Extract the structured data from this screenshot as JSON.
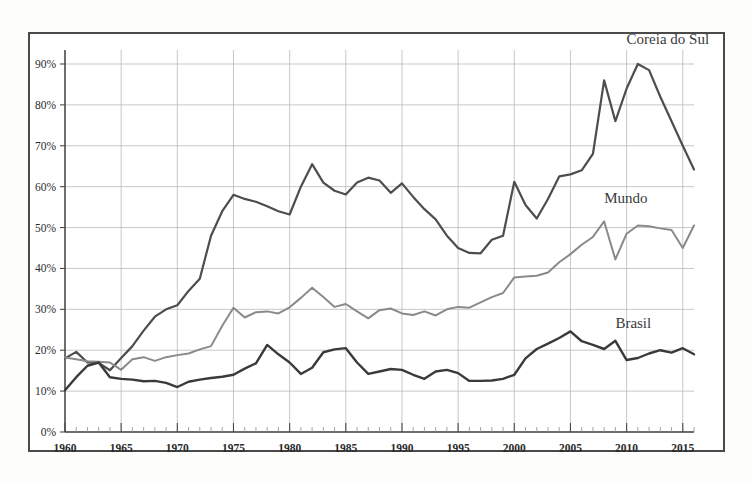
{
  "chart_data": {
    "type": "line",
    "title": "",
    "subtitle": "",
    "xlabel": "",
    "ylabel": "",
    "xlim": [
      1960,
      2016
    ],
    "ylim": [
      0,
      95
    ],
    "grid": true,
    "legend_position": "inline-right",
    "y_ticks": [
      "0%",
      "10%",
      "20%",
      "30%",
      "40%",
      "50%",
      "60%",
      "70%",
      "80%",
      "90%"
    ],
    "y_tick_values": [
      0,
      10,
      20,
      30,
      40,
      50,
      60,
      70,
      80,
      90
    ],
    "x_ticks": [
      "1960",
      "1965",
      "1970",
      "1975",
      "1980",
      "1985",
      "1990",
      "1995",
      "2000",
      "2005",
      "2010",
      "2015"
    ],
    "x_tick_values": [
      1960,
      1965,
      1970,
      1975,
      1980,
      1985,
      1990,
      1995,
      2000,
      2005,
      2010,
      2015
    ],
    "x": [
      1960,
      1961,
      1962,
      1963,
      1964,
      1965,
      1966,
      1967,
      1968,
      1969,
      1970,
      1971,
      1972,
      1973,
      1974,
      1975,
      1976,
      1977,
      1978,
      1979,
      1980,
      1981,
      1982,
      1983,
      1984,
      1985,
      1986,
      1987,
      1988,
      1989,
      1990,
      1991,
      1992,
      1993,
      1994,
      1995,
      1996,
      1997,
      1998,
      1999,
      2000,
      2001,
      2002,
      2003,
      2004,
      2005,
      2006,
      2007,
      2008,
      2009,
      2010,
      2011,
      2012,
      2013,
      2014,
      2015,
      2016
    ],
    "series": [
      {
        "name": "Coreia do Sul",
        "color": "#4d4d4d",
        "width": 2.2,
        "label_x": 2010,
        "label_y": 95,
        "values": [
          18.0,
          19.6,
          17.0,
          16.9,
          15.1,
          18.1,
          21.0,
          24.8,
          28.2,
          30.0,
          31.0,
          34.5,
          37.5,
          48.0,
          54.0,
          58.0,
          57.0,
          56.3,
          55.2,
          54.0,
          53.2,
          60.0,
          65.5,
          61.0,
          59.0,
          58.1,
          61.0,
          62.2,
          61.5,
          58.5,
          60.8,
          57.5,
          54.5,
          52.0,
          48.0,
          45.0,
          43.8,
          43.7,
          47.0,
          48.0,
          61.2,
          55.5,
          52.2,
          57.0,
          62.5,
          63.0,
          64.0,
          68.0,
          86.0,
          76.0,
          84.0,
          90.0,
          88.5,
          82.0,
          76.0,
          70.0,
          64.2
        ]
      },
      {
        "name": "Mundo",
        "color": "#8a8a8a",
        "width": 2.0,
        "label_x": 2008,
        "label_y": 56,
        "values": [
          18.2,
          17.8,
          17.3,
          17.2,
          17.0,
          15.2,
          17.8,
          18.3,
          17.4,
          18.3,
          18.8,
          19.2,
          20.2,
          21.0,
          26.0,
          30.4,
          28.0,
          29.3,
          29.5,
          29.0,
          30.5,
          32.8,
          35.3,
          33.0,
          30.6,
          31.3,
          29.5,
          27.8,
          29.8,
          30.2,
          29.0,
          28.6,
          29.5,
          28.5,
          30.0,
          30.6,
          30.4,
          31.7,
          33.0,
          34.0,
          37.8,
          38.0,
          38.2,
          39.0,
          41.5,
          43.5,
          45.8,
          47.7,
          51.5,
          42.2,
          48.5,
          50.5,
          50.3,
          49.8,
          49.4,
          45.0,
          50.5
        ]
      },
      {
        "name": "Brasil",
        "color": "#3a3a3a",
        "width": 2.4,
        "label_x": 2009,
        "label_y": 25.5,
        "values": [
          10.2,
          13.4,
          16.2,
          17.0,
          13.4,
          13.0,
          12.8,
          12.4,
          12.5,
          12.0,
          11.0,
          12.3,
          12.8,
          13.2,
          13.5,
          14.0,
          15.5,
          16.8,
          21.3,
          19.0,
          17.0,
          14.2,
          15.7,
          19.5,
          20.2,
          20.5,
          17.0,
          14.2,
          14.8,
          15.4,
          15.2,
          14.0,
          13.0,
          14.8,
          15.2,
          14.4,
          12.5,
          12.5,
          12.6,
          13.0,
          14.0,
          18.0,
          20.3,
          21.6,
          23.0,
          24.6,
          22.2,
          21.3,
          20.3,
          22.3,
          17.6,
          18.1,
          19.2,
          20.0,
          19.4,
          20.5,
          19.0
        ]
      }
    ]
  },
  "annotations": {
    "korea_label": "Coreia do Sul",
    "world_label": "Mundo",
    "brazil_label": "Brasil"
  }
}
